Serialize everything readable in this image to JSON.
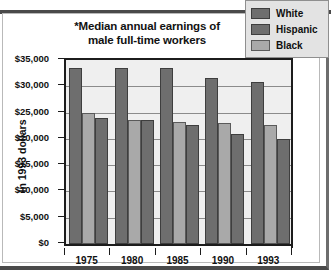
{
  "chart_data": {
    "type": "bar",
    "title": "*Median annual earnings of male full-time workers",
    "title_line1": "*Median annual earnings of",
    "title_line2": "male full-time workers",
    "xlabel": "",
    "ylabel": "In 1993 dollars",
    "categories": [
      "1975",
      "1980",
      "1985",
      "1990",
      "1993"
    ],
    "ylim": [
      0,
      35000
    ],
    "ytick_values": [
      0,
      5000,
      10000,
      15000,
      20000,
      25000,
      30000,
      35000
    ],
    "ytick_labels": [
      "$0",
      "$5,000",
      "$10,000",
      "$15,000",
      "$20,000",
      "$25,000",
      "$30,000",
      "$35,000"
    ],
    "grid": true,
    "legend_position": "top-right",
    "series": [
      {
        "name": "White",
        "color": "#6e6e6e",
        "values": [
          33500,
          33500,
          33400,
          31600,
          30800
        ]
      },
      {
        "name": "Hispanic",
        "color": "#a9a9a9",
        "values": [
          24900,
          23600,
          23200,
          23000,
          22700
        ]
      },
      {
        "name": "Black",
        "color": "#6e6e6e",
        "values": [
          24000,
          23500,
          22700,
          21000,
          20000
        ]
      }
    ]
  },
  "legend": {
    "items": [
      {
        "label": "White",
        "swatch": "white-series"
      },
      {
        "label": "Hispanic",
        "swatch": "hispanic-series"
      },
      {
        "label": "Black",
        "swatch": "black-series"
      }
    ]
  }
}
